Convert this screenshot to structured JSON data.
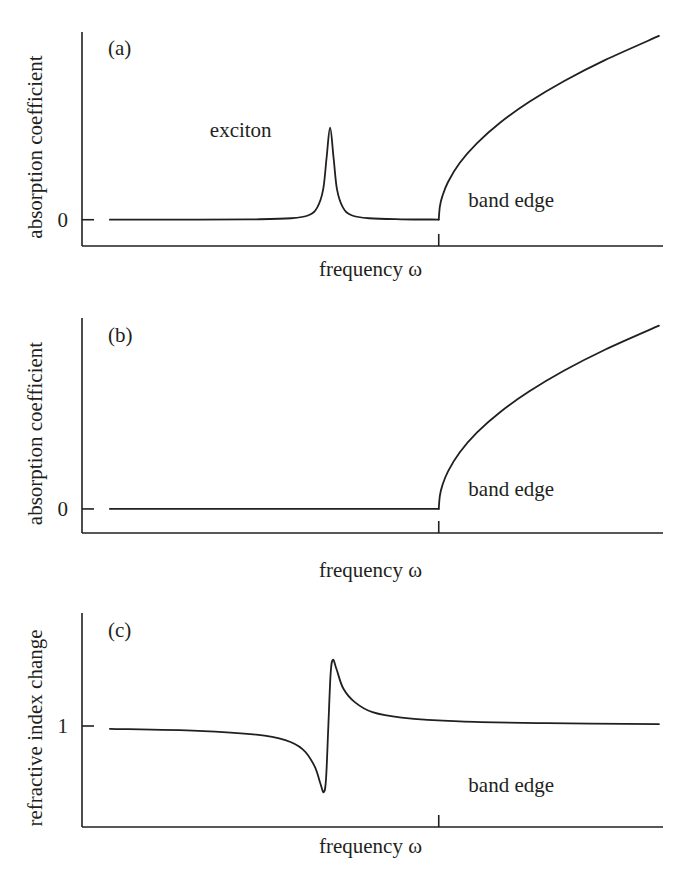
{
  "chart_data": [
    {
      "type": "line",
      "panel": "(a)",
      "xlabel": "frequency ω",
      "ylabel": "absorption coefficient",
      "xlim": [
        0,
        100
      ],
      "ylim": [
        -0.14,
        1.0
      ],
      "yticks": [
        {
          "value": 0,
          "label": "0"
        }
      ],
      "xticks": [
        {
          "value": 61.4,
          "label": ""
        }
      ],
      "grid": false,
      "annotations": [
        {
          "text": "exciton",
          "x": 22,
          "y": 0.44
        },
        {
          "text": "band edge",
          "x": 66.5,
          "y": 0.07
        }
      ],
      "series": [
        {
          "name": "exciton absorption",
          "x": [
            4.8,
            20,
            30,
            36,
            39,
            40.5,
            41.5,
            42.1,
            42.7,
            43.3,
            43.9,
            44.9,
            46.4,
            49.4,
            55,
            61.4
          ],
          "y": [
            0,
            0.0007,
            0.0022,
            0.0078,
            0.024,
            0.066,
            0.16,
            0.33,
            0.49,
            0.33,
            0.16,
            0.066,
            0.024,
            0.0078,
            0.0023,
            0.001
          ]
        },
        {
          "name": "band-edge absorption",
          "x": [
            61.4,
            61.6,
            62,
            63,
            65,
            68,
            72,
            77,
            83,
            90,
            99.3
          ],
          "y": [
            0,
            0.071,
            0.123,
            0.201,
            0.302,
            0.408,
            0.518,
            0.628,
            0.739,
            0.85,
            0.979
          ]
        }
      ]
    },
    {
      "type": "line",
      "panel": "(b)",
      "xlabel": "frequency ω",
      "ylabel": "absorption coefficient",
      "xlim": [
        0,
        100
      ],
      "ylim": [
        -0.126,
        1.0
      ],
      "yticks": [
        {
          "value": 0,
          "label": "0"
        }
      ],
      "xticks": [
        {
          "value": 61.4,
          "label": ""
        }
      ],
      "grid": false,
      "annotations": [
        {
          "text": "band edge",
          "x": 66.5,
          "y": 0.07
        }
      ],
      "series": [
        {
          "name": "below gap",
          "x": [
            4.8,
            61.4
          ],
          "y": [
            0,
            0
          ]
        },
        {
          "name": "band-edge absorption",
          "x": [
            61.4,
            61.6,
            62,
            63,
            65,
            68,
            72,
            77,
            83,
            90,
            99.3
          ],
          "y": [
            0,
            0.07,
            0.121,
            0.197,
            0.296,
            0.401,
            0.508,
            0.616,
            0.725,
            0.834,
            0.96
          ]
        }
      ]
    },
    {
      "type": "line",
      "panel": "(c)",
      "xlabel": "frequency ω",
      "ylabel": "refractive index change",
      "xlim": [
        0,
        100
      ],
      "ylim": [
        0.495,
        1.565
      ],
      "yticks": [
        {
          "value": 1,
          "label": "1"
        }
      ],
      "xticks": [
        {
          "value": 61.4,
          "label": ""
        }
      ],
      "grid": false,
      "annotations": [
        {
          "text": "band edge",
          "x": 66.5,
          "y": 0.67
        }
      ],
      "series": [
        {
          "name": "refractive index",
          "x": [
            4.8,
            20,
            30,
            35,
            38,
            40,
            41,
            41.6,
            42.0,
            42.4,
            42.8,
            43.2,
            43.8,
            45,
            47,
            50,
            55,
            65,
            80,
            99.3
          ],
          "y": [
            0.986,
            0.976,
            0.957,
            0.929,
            0.883,
            0.801,
            0.715,
            0.669,
            0.735,
            1.0,
            1.265,
            1.331,
            1.285,
            1.186,
            1.118,
            1.069,
            1.042,
            1.023,
            1.014,
            1.009
          ]
        }
      ]
    }
  ]
}
